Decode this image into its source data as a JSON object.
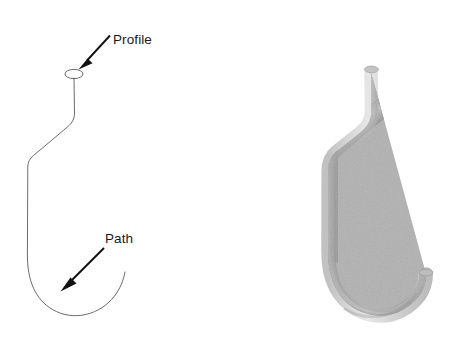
{
  "figure": {
    "background_color": "#ffffff",
    "width": 453,
    "height": 349,
    "line_color": "#5a5a5a",
    "annotation_color": "#111111",
    "solid_color_light": "#c9c9c9",
    "solid_color_mid": "#a6a6a6",
    "solid_color_dark": "#7e7e7e"
  },
  "annotations": {
    "profile": {
      "label": "Profile",
      "label_x": 113,
      "label_y": 44,
      "arrow_tail_x": 110,
      "arrow_tail_y": 35,
      "arrow_tip_x": 80,
      "arrow_tip_y": 68
    },
    "path": {
      "label": "Path",
      "label_x": 105,
      "label_y": 243,
      "arrow_tail_x": 104,
      "arrow_tail_y": 248,
      "arrow_tip_x": 60,
      "arrow_tip_y": 291
    }
  },
  "left_view": {
    "name": "wireframe-sweep-diagram",
    "profile_circle": {
      "cx": 74,
      "cy": 74,
      "rx": 9,
      "ry": 4.5
    },
    "path_curve": "M 74 78 L 74.5 113 C 74.5 120 70 124 66 128 L 33 156 C 29.5 159 28 162 27.8 167 L 27.5 255 C 27.3 281 35 299 52 309 C 74 321 100 314 114 296 C 120 288 123 281 125 272"
  },
  "right_view": {
    "name": "shaded-3d-hook",
    "description": "Gray shaded 3D swept hook solid",
    "centerline": "M 371 72 L 371.5 110 C 371.5 120 367 127 361 132 L 336 152 C 330 157 328 163 328 171 L 328 252 C 328 281 339 300 357 310 C 381 322 405 314 419 296 C 424 289 426 283 426 274",
    "tube_width": 13
  }
}
